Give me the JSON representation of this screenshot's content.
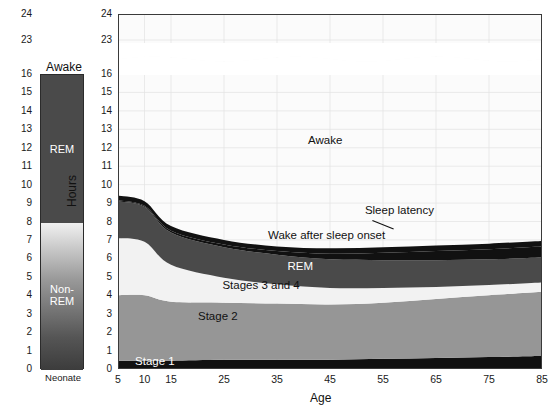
{
  "figure": {
    "x_axis_title": "Age",
    "y_axis_title": "Hours"
  },
  "neonate_panel": {
    "caption": "Neonate",
    "awake_label": "Awake",
    "segments": [
      {
        "name": "REM",
        "label": "REM",
        "from": 8,
        "to": 16,
        "color": "#4a4a4a",
        "label_color": "dark"
      },
      {
        "name": "Non-REM",
        "label": "Non-\nREM",
        "from": 0,
        "to": 8,
        "color": "#8e8e8e",
        "label_color": "dark"
      }
    ],
    "ticks": [
      24,
      23,
      16,
      15,
      14,
      13,
      12,
      11,
      10,
      9,
      8,
      7,
      6,
      5,
      4,
      3,
      2,
      1,
      0
    ]
  },
  "annotations": {
    "awake": "Awake",
    "sleep_latency": "Sleep latency",
    "wake_after_sleep_onset": "Wake after sleep onset",
    "rem": "REM",
    "stages_3_and_4": "Stages 3 and 4",
    "stage_2": "Stage 2",
    "stage_1": "Stage 1"
  },
  "colors": {
    "awake": "#fbfbfb",
    "sleep_latency": "#111111",
    "wake_after_sleep_onset": "#111111",
    "rem": "#4a4a4a",
    "stages_3_and_4": "#f2f2f2",
    "stage_2": "#969696",
    "stage_1": "#111111",
    "grid": "#e2e2e2",
    "axis": "#3a3a3a"
  },
  "chart_data": {
    "type": "area",
    "title": "",
    "subtitle": "",
    "xlabel": "Age",
    "ylabel": "Hours",
    "xlim": [
      5,
      85
    ],
    "ylim": [
      0,
      24
    ],
    "y_axis_break": [
      16,
      23
    ],
    "grid": true,
    "legend": "inline-band-labels",
    "x_tick_labels": [
      5,
      10,
      15,
      25,
      35,
      45,
      55,
      65,
      75,
      85
    ],
    "y_tick_labels": [
      24,
      23,
      16,
      15,
      14,
      13,
      12,
      11,
      10,
      9,
      8,
      7,
      6,
      5,
      4,
      3,
      2,
      1,
      0
    ],
    "x": [
      5,
      10,
      15,
      25,
      35,
      45,
      55,
      65,
      75,
      85
    ],
    "stacking": "bottom-to-top",
    "series": [
      {
        "name": "Stage 1",
        "values": [
          0.45,
          0.45,
          0.45,
          0.5,
          0.5,
          0.5,
          0.55,
          0.6,
          0.65,
          0.7
        ]
      },
      {
        "name": "Stage 2",
        "values": [
          3.55,
          3.55,
          3.2,
          3.1,
          3.05,
          3.0,
          3.05,
          3.2,
          3.35,
          3.5
        ]
      },
      {
        "name": "Stages 3 and 4",
        "values": [
          3.1,
          2.9,
          2.0,
          1.35,
          1.05,
          0.9,
          0.8,
          0.65,
          0.55,
          0.5
        ]
      },
      {
        "name": "REM",
        "values": [
          2.0,
          1.9,
          1.75,
          1.65,
          1.6,
          1.55,
          1.5,
          1.45,
          1.4,
          1.35
        ]
      },
      {
        "name": "Wake after sleep onset",
        "values": [
          0.05,
          0.05,
          0.1,
          0.15,
          0.2,
          0.3,
          0.4,
          0.5,
          0.55,
          0.6
        ]
      },
      {
        "name": "Sleep latency",
        "values": [
          0.25,
          0.25,
          0.25,
          0.25,
          0.25,
          0.3,
          0.3,
          0.3,
          0.3,
          0.3
        ]
      },
      {
        "name": "Awake",
        "values": [
          14.6,
          14.9,
          16.25,
          17.0,
          17.35,
          17.45,
          17.4,
          17.3,
          17.2,
          17.05
        ]
      }
    ],
    "total_hours": 24
  }
}
